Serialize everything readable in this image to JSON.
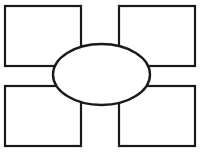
{
  "canvas": {
    "width": 201,
    "height": 162,
    "background_color": "#ffffff",
    "stroke_color": "#1a1a1a"
  },
  "diagram": {
    "title": "",
    "type": "concept-map-template",
    "center_node": {
      "shape": "ellipse",
      "label": "",
      "cx": 101.5,
      "cy": 74.5,
      "rx": 48.5,
      "ry": 30.5
    },
    "outer_nodes": [
      {
        "id": "top-left",
        "shape": "rectangle",
        "label": "",
        "x": 5,
        "y": 6,
        "width": 76,
        "height": 60
      },
      {
        "id": "top-right",
        "shape": "rectangle",
        "label": "",
        "x": 119,
        "y": 6,
        "width": 76,
        "height": 60
      },
      {
        "id": "bottom-left",
        "shape": "rectangle",
        "label": "",
        "x": 5,
        "y": 86,
        "width": 76,
        "height": 60
      },
      {
        "id": "bottom-right",
        "shape": "rectangle",
        "label": "",
        "x": 119,
        "y": 86,
        "width": 76,
        "height": 60
      }
    ]
  },
  "footer": {
    "faint_text": ""
  }
}
